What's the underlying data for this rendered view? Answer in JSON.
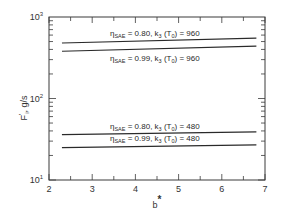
{
  "chart_data": {
    "type": "line",
    "title": "",
    "xlabel": "b*",
    "ylabel": "F'_i, g/s",
    "xscale": "linear",
    "yscale": "log",
    "xlim": [
      2,
      7
    ],
    "ylim": [
      10,
      1000
    ],
    "x_ticks": [
      2,
      3,
      4,
      5,
      6,
      7
    ],
    "x_tick_labels": [
      "2",
      "3",
      "4",
      "5",
      "6",
      "7"
    ],
    "y_ticks": [
      10,
      100,
      1000
    ],
    "y_tick_labels": [
      {
        "base": "10",
        "exp": "1"
      },
      {
        "base": "10",
        "exp": "2"
      },
      {
        "base": "10",
        "exp": "3"
      }
    ],
    "grid": false,
    "legend": "inline annotations",
    "series": [
      {
        "name": "η_SAE = 0.80, k_3 (T_0) = 960",
        "eta_label": "0.80",
        "k_label": "960",
        "x": [
          2.3,
          6.8
        ],
        "values": [
          480,
          550
        ]
      },
      {
        "name": "η_SAE = 0.99, k_3 (T_0) = 960",
        "eta_label": "0.99",
        "k_label": "960",
        "x": [
          2.3,
          6.8
        ],
        "values": [
          380,
          440
        ]
      },
      {
        "name": "η_SAE = 0.80, k_3 (T_0) = 480",
        "eta_label": "0.80",
        "k_label": "480",
        "x": [
          2.3,
          6.8
        ],
        "values": [
          36,
          39
        ]
      },
      {
        "name": "η_SAE = 0.99, k_3 (T_0) = 480",
        "eta_label": "0.99",
        "k_label": "480",
        "x": [
          2.3,
          6.8
        ],
        "values": [
          25,
          27
        ]
      }
    ]
  },
  "labels": {
    "eta": "η",
    "sae": "SAE",
    "k": "k",
    "k_sub": "3",
    "t": "T",
    "t_sub": "0",
    "y_axis_main": "F",
    "y_axis_prime": "'",
    "y_axis_sub": "i",
    "y_axis_unit": ", g/s",
    "x_axis_main": "b",
    "x_axis_star": "*"
  }
}
